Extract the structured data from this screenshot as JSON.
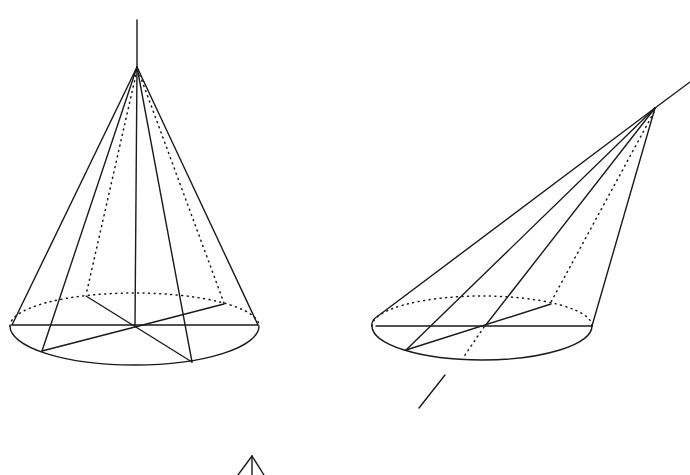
{
  "figure": {
    "title": "",
    "stroke_color": "#1a1a1a",
    "background": "#ffffff",
    "panels": [
      {
        "id": "upright-cone",
        "label": "",
        "apex": [
          137,
          67
        ],
        "axis_top": [
          137,
          20
        ],
        "base_center": [
          134,
          326
        ]
      },
      {
        "id": "oblique-cone",
        "label": "",
        "apex": [
          655,
          108
        ],
        "axis_end": [
          690,
          82
        ],
        "base_center": [
          485,
          326
        ]
      },
      {
        "id": "partial-cone",
        "label": "",
        "apex": [
          252,
          456
        ]
      }
    ]
  }
}
